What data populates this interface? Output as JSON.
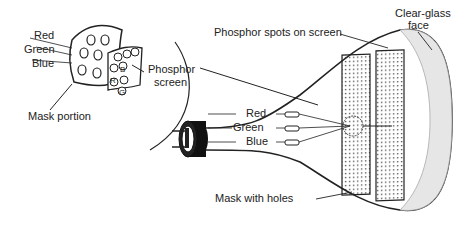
{
  "inset": {
    "labels": {
      "red": "Red",
      "green": "Green",
      "blue": "Blue",
      "phosphor_screen_line1": "Phosphor",
      "phosphor_screen_line2": "screen",
      "mask_portion": "Mask portion"
    },
    "dot_letters": {
      "r": "R",
      "g": "G",
      "b": "B"
    }
  },
  "tube": {
    "labels": {
      "phosphor_spots": "Phosphor spots on screen",
      "clear_glass_line1": "Clear-glass",
      "clear_glass_line2": "face",
      "gun_red": "Red",
      "gun_green": "Green",
      "gun_blue": "Blue",
      "mask_with_holes": "Mask with holes"
    }
  },
  "colors": {
    "ink": "#222222",
    "background": "#ffffff",
    "glass": "#e6e6e6"
  }
}
